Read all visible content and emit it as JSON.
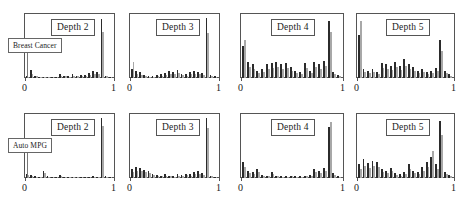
{
  "figure": {
    "row_labels": [
      {
        "text": "Breast Cancer"
      },
      {
        "text": "Auto MPG"
      }
    ],
    "tick_labels": {
      "left": "0",
      "right": "1"
    },
    "colors": {
      "dark": "#2b2b2b",
      "light": "#a8a8a8",
      "frame": "#555555"
    }
  },
  "chart_data": [
    {
      "type": "bar",
      "title": "Depth 2",
      "row": "Breast Cancer",
      "xlabel": "",
      "ylabel": "",
      "xlim": [
        0,
        1
      ],
      "ylim": [
        0,
        1
      ],
      "grid": false,
      "legend": "none",
      "categories": [
        0.0,
        0.05,
        0.1,
        0.15,
        0.2,
        0.25,
        0.3,
        0.35,
        0.4,
        0.45,
        0.5,
        0.55,
        0.6,
        0.65,
        0.7,
        0.75,
        0.8,
        0.85,
        0.9,
        0.95,
        1.0
      ],
      "series": [
        {
          "name": "dark",
          "values": [
            0.03,
            0.13,
            0.04,
            0.02,
            0.01,
            0.01,
            0.02,
            0.02,
            0.06,
            0.04,
            0.03,
            0.06,
            0.04,
            0.05,
            0.05,
            0.08,
            0.11,
            0.09,
            0.95,
            0.04,
            0.02
          ]
        },
        {
          "name": "light",
          "values": [
            0.02,
            0.07,
            0.03,
            0.01,
            0.01,
            0.01,
            0.01,
            0.02,
            0.04,
            0.03,
            0.02,
            0.04,
            0.03,
            0.03,
            0.04,
            0.05,
            0.07,
            0.06,
            0.74,
            0.03,
            0.01
          ]
        }
      ]
    },
    {
      "type": "bar",
      "title": "Depth 3",
      "row": "Breast Cancer",
      "xlabel": "",
      "ylabel": "",
      "xlim": [
        0,
        1
      ],
      "ylim": [
        0,
        1
      ],
      "grid": false,
      "legend": "none",
      "categories": [
        0.0,
        0.05,
        0.1,
        0.15,
        0.2,
        0.25,
        0.3,
        0.35,
        0.4,
        0.45,
        0.5,
        0.55,
        0.6,
        0.65,
        0.7,
        0.75,
        0.8,
        0.85,
        0.9,
        0.95,
        1.0
      ],
      "series": [
        {
          "name": "dark",
          "values": [
            0.14,
            0.12,
            0.09,
            0.05,
            0.04,
            0.04,
            0.05,
            0.06,
            0.08,
            0.12,
            0.1,
            0.13,
            0.07,
            0.06,
            0.09,
            0.11,
            0.1,
            0.08,
            0.96,
            0.05,
            0.03
          ]
        },
        {
          "name": "light",
          "values": [
            0.26,
            0.07,
            0.05,
            0.03,
            0.02,
            0.02,
            0.03,
            0.04,
            0.05,
            0.07,
            0.06,
            0.08,
            0.05,
            0.04,
            0.06,
            0.07,
            0.06,
            0.05,
            0.72,
            0.03,
            0.02
          ]
        }
      ]
    },
    {
      "type": "bar",
      "title": "Depth 4",
      "row": "Breast Cancer",
      "xlabel": "",
      "ylabel": "",
      "xlim": [
        0,
        1
      ],
      "ylim": [
        0,
        1
      ],
      "grid": false,
      "legend": "none",
      "categories": [
        0.0,
        0.05,
        0.1,
        0.15,
        0.2,
        0.25,
        0.3,
        0.35,
        0.4,
        0.45,
        0.5,
        0.55,
        0.6,
        0.65,
        0.7,
        0.75,
        0.8,
        0.85,
        0.9,
        0.95,
        1.0
      ],
      "series": [
        {
          "name": "dark",
          "values": [
            0.52,
            0.26,
            0.22,
            0.12,
            0.14,
            0.22,
            0.24,
            0.26,
            0.22,
            0.24,
            0.18,
            0.12,
            0.1,
            0.24,
            0.12,
            0.26,
            0.22,
            0.28,
            0.92,
            0.1,
            0.05
          ]
        },
        {
          "name": "light",
          "values": [
            0.62,
            0.18,
            0.15,
            0.08,
            0.1,
            0.15,
            0.16,
            0.18,
            0.15,
            0.16,
            0.12,
            0.08,
            0.07,
            0.16,
            0.08,
            0.18,
            0.15,
            0.19,
            0.74,
            0.07,
            0.03
          ]
        }
      ]
    },
    {
      "type": "bar",
      "title": "Depth 5",
      "row": "Breast Cancer",
      "xlabel": "",
      "ylabel": "",
      "xlim": [
        0,
        1
      ],
      "ylim": [
        0,
        1
      ],
      "grid": false,
      "legend": "none",
      "categories": [
        0.0,
        0.05,
        0.1,
        0.15,
        0.2,
        0.25,
        0.3,
        0.35,
        0.4,
        0.45,
        0.5,
        0.55,
        0.6,
        0.65,
        0.7,
        0.75,
        0.8,
        0.85,
        0.9,
        0.95,
        1.0
      ],
      "series": [
        {
          "name": "dark",
          "values": [
            0.7,
            0.14,
            0.12,
            0.14,
            0.1,
            0.24,
            0.22,
            0.2,
            0.26,
            0.2,
            0.3,
            0.22,
            0.18,
            0.12,
            0.14,
            0.1,
            0.12,
            0.16,
            0.62,
            0.12,
            0.06
          ]
        },
        {
          "name": "light",
          "values": [
            0.92,
            0.09,
            0.08,
            0.09,
            0.07,
            0.16,
            0.15,
            0.13,
            0.18,
            0.13,
            0.2,
            0.15,
            0.12,
            0.08,
            0.09,
            0.07,
            0.08,
            0.11,
            0.44,
            0.08,
            0.04
          ]
        }
      ]
    },
    {
      "type": "bar",
      "title": "Depth 2",
      "row": "Auto MPG",
      "xlabel": "",
      "ylabel": "",
      "xlim": [
        0,
        1
      ],
      "ylim": [
        0,
        1
      ],
      "grid": false,
      "legend": "none",
      "categories": [
        0.0,
        0.05,
        0.1,
        0.15,
        0.2,
        0.25,
        0.3,
        0.35,
        0.4,
        0.45,
        0.5,
        0.55,
        0.6,
        0.65,
        0.7,
        0.75,
        0.8,
        0.85,
        0.9,
        0.95,
        1.0
      ],
      "series": [
        {
          "name": "dark",
          "values": [
            0.07,
            0.05,
            0.03,
            0.02,
            0.12,
            0.03,
            0.02,
            0.01,
            0.05,
            0.02,
            0.02,
            0.01,
            0.01,
            0.01,
            0.01,
            0.02,
            0.03,
            0.02,
            0.97,
            0.03,
            0.01
          ]
        },
        {
          "name": "light",
          "values": [
            0.05,
            0.03,
            0.02,
            0.01,
            0.08,
            0.02,
            0.01,
            0.01,
            0.03,
            0.01,
            0.01,
            0.01,
            0.01,
            0.01,
            0.01,
            0.01,
            0.02,
            0.01,
            0.84,
            0.02,
            0.01
          ]
        }
      ]
    },
    {
      "type": "bar",
      "title": "Depth 3",
      "row": "Auto MPG",
      "xlabel": "",
      "ylabel": "",
      "xlim": [
        0,
        1
      ],
      "ylim": [
        0,
        1
      ],
      "grid": false,
      "legend": "none",
      "categories": [
        0.0,
        0.05,
        0.1,
        0.15,
        0.2,
        0.25,
        0.3,
        0.35,
        0.4,
        0.45,
        0.5,
        0.55,
        0.6,
        0.65,
        0.7,
        0.75,
        0.8,
        0.85,
        0.9,
        0.95,
        1.0
      ],
      "series": [
        {
          "name": "dark",
          "values": [
            0.14,
            0.17,
            0.16,
            0.13,
            0.11,
            0.07,
            0.05,
            0.04,
            0.06,
            0.04,
            0.03,
            0.06,
            0.05,
            0.07,
            0.06,
            0.09,
            0.11,
            0.08,
            0.96,
            0.04,
            0.02
          ]
        },
        {
          "name": "light",
          "values": [
            0.1,
            0.12,
            0.11,
            0.09,
            0.08,
            0.05,
            0.03,
            0.03,
            0.04,
            0.03,
            0.02,
            0.04,
            0.03,
            0.05,
            0.04,
            0.06,
            0.07,
            0.05,
            0.8,
            0.03,
            0.01
          ]
        }
      ]
    },
    {
      "type": "bar",
      "title": "Depth 4",
      "row": "Auto MPG",
      "xlabel": "",
      "ylabel": "",
      "xlim": [
        0,
        1
      ],
      "ylim": [
        0,
        1
      ],
      "grid": false,
      "legend": "none",
      "categories": [
        0.0,
        0.05,
        0.1,
        0.15,
        0.2,
        0.25,
        0.3,
        0.35,
        0.4,
        0.45,
        0.5,
        0.55,
        0.6,
        0.65,
        0.7,
        0.75,
        0.8,
        0.85,
        0.9,
        0.95,
        1.0
      ],
      "series": [
        {
          "name": "dark",
          "values": [
            0.26,
            0.12,
            0.1,
            0.14,
            0.05,
            0.04,
            0.09,
            0.04,
            0.03,
            0.03,
            0.04,
            0.03,
            0.03,
            0.04,
            0.05,
            0.14,
            0.12,
            0.16,
            0.82,
            0.08,
            0.04
          ]
        },
        {
          "name": "light",
          "values": [
            0.18,
            0.08,
            0.07,
            0.1,
            0.03,
            0.03,
            0.06,
            0.03,
            0.02,
            0.02,
            0.03,
            0.02,
            0.02,
            0.03,
            0.03,
            0.1,
            0.08,
            0.11,
            0.9,
            0.05,
            0.02
          ]
        }
      ]
    },
    {
      "type": "bar",
      "title": "Depth 5",
      "row": "Auto MPG",
      "xlabel": "",
      "ylabel": "",
      "xlim": [
        0,
        1
      ],
      "ylim": [
        0,
        1
      ],
      "grid": false,
      "legend": "none",
      "categories": [
        0.0,
        0.05,
        0.1,
        0.15,
        0.2,
        0.25,
        0.3,
        0.35,
        0.4,
        0.45,
        0.5,
        0.55,
        0.6,
        0.65,
        0.7,
        0.75,
        0.8,
        0.85,
        0.9,
        0.95,
        1.0
      ],
      "series": [
        {
          "name": "dark",
          "values": [
            0.22,
            0.3,
            0.24,
            0.28,
            0.26,
            0.14,
            0.12,
            0.16,
            0.08,
            0.06,
            0.1,
            0.22,
            0.12,
            0.1,
            0.18,
            0.26,
            0.34,
            0.22,
            0.92,
            0.1,
            0.05
          ]
        },
        {
          "name": "light",
          "values": [
            0.15,
            0.2,
            0.16,
            0.19,
            0.18,
            0.09,
            0.08,
            0.11,
            0.05,
            0.04,
            0.07,
            0.15,
            0.08,
            0.07,
            0.12,
            0.18,
            0.44,
            0.15,
            0.7,
            0.07,
            0.03
          ]
        }
      ]
    }
  ]
}
